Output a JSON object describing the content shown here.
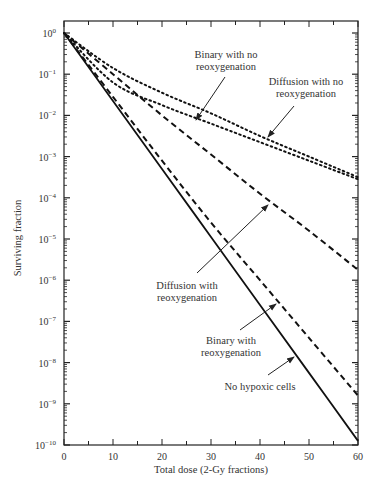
{
  "chart_data": {
    "type": "line",
    "title": "",
    "xlabel": "Total dose (2-Gy fractions)",
    "ylabel": "Surviving fraction",
    "xlim": [
      0,
      60
    ],
    "ylim": [
      1e-10,
      1
    ],
    "yscale": "log",
    "grid": false,
    "legend": "none (inline annotations with arrows)",
    "x_ticks": [
      0,
      10,
      20,
      30,
      40,
      50,
      60
    ],
    "y_ticks": [
      "10^0",
      "10^-1",
      "10^-2",
      "10^-3",
      "10^-4",
      "10^-5",
      "10^-6",
      "10^-7",
      "10^-8",
      "10^-9",
      "10^-10"
    ],
    "x": [
      0,
      10,
      20,
      30,
      40,
      50,
      60
    ],
    "series": [
      {
        "name": "Binary with no reoxygenation",
        "style": "dotted",
        "log10_values": [
          0,
          -1.2,
          -1.75,
          -2.2,
          -2.65,
          -3.1,
          -3.55
        ],
        "values": [
          1,
          0.063,
          0.018,
          0.0063,
          0.0022,
          0.00079,
          0.00028
        ]
      },
      {
        "name": "Diffusion with no reoxygenation",
        "style": "dotted",
        "log10_values": [
          0,
          -0.85,
          -1.45,
          -1.95,
          -2.5,
          -3.0,
          -3.5
        ],
        "values": [
          1,
          0.14,
          0.035,
          0.011,
          0.0032,
          0.001,
          0.00032
        ]
      },
      {
        "name": "Diffusion with reoxygenation",
        "style": "dashed",
        "log10_values": [
          0,
          -1.0,
          -2.0,
          -2.95,
          -3.9,
          -4.8,
          -5.75
        ],
        "values": [
          1,
          0.1,
          0.01,
          0.0011,
          0.00013,
          1.6e-05,
          1.8e-06
        ]
      },
      {
        "name": "Binary with reoxygenation",
        "style": "dashed",
        "log10_values": [
          0,
          -1.55,
          -3.1,
          -4.6,
          -6.0,
          -7.4,
          -8.8
        ],
        "values": [
          1,
          0.028,
          0.00079,
          2.5e-05,
          1e-06,
          4e-08,
          1.6e-09
        ]
      },
      {
        "name": "No hypoxic cells",
        "style": "solid",
        "log10_values": [
          0,
          -1.65,
          -3.3,
          -4.95,
          -6.6,
          -8.25,
          -9.9
        ],
        "values": [
          1,
          0.022,
          0.0005,
          1.1e-05,
          2.5e-07,
          5.6e-09,
          1.3e-10
        ]
      }
    ],
    "annotations": [
      {
        "text": [
          "Binary with no",
          "reoxygenation"
        ],
        "arrow_to_dose": 27
      },
      {
        "text": [
          "Diffusion with no",
          "reoxygenation"
        ],
        "arrow_to_dose": 42
      },
      {
        "text": [
          "Diffusion",
          "with",
          "reoxygenation"
        ],
        "arrow_to_dose": 42
      },
      {
        "text": [
          "Binary with",
          "reoxygenation"
        ],
        "arrow_to_dose": 37
      },
      {
        "text": [
          "No hypoxic cells"
        ],
        "arrow_to_dose": 40
      }
    ]
  },
  "labels": {
    "xlabel": "Total dose (2-Gy fractions)",
    "ylabel": "Surviving fraction",
    "xticks": [
      "0",
      "10",
      "20",
      "30",
      "40",
      "50",
      "60"
    ],
    "yexp": [
      "0",
      "−1",
      "−2",
      "−3",
      "−4",
      "−5",
      "−6",
      "−7",
      "−8",
      "−9",
      "−10"
    ],
    "ann_binary_noreox_1": "Binary with no",
    "ann_binary_noreox_2": "reoxygenation",
    "ann_diff_noreox_1": "Diffusion with no",
    "ann_diff_noreox_2": "reoxygenation",
    "ann_diff_reox_1": "Diffusion with",
    "ann_diff_reox_2": "reoxygenation",
    "ann_binary_reox_1": "Binary with",
    "ann_binary_reox_2": "reoxygenation",
    "ann_nohypoxic": "No hypoxic cells"
  }
}
